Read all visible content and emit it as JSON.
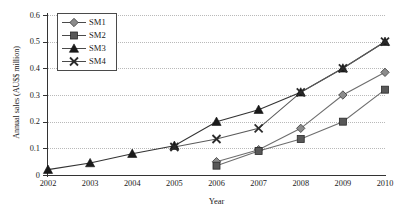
{
  "chart_data": {
    "type": "line",
    "title": "",
    "xlabel": "Year",
    "ylabel": "Annual sales (AU$$ million)",
    "categories": [
      "2002",
      "2003",
      "2004",
      "2005",
      "2006",
      "2007",
      "2008",
      "2009",
      "2010"
    ],
    "x": [
      2002,
      2003,
      2004,
      2005,
      2006,
      2007,
      2008,
      2009,
      2010
    ],
    "xlim": [
      2002,
      2010
    ],
    "ylim": [
      0,
      0.6
    ],
    "yticks": [
      "0",
      "0.1",
      "0.2",
      "0.3",
      "0.4",
      "0.5",
      "0.6"
    ],
    "ytick_values": [
      0,
      0.1,
      0.2,
      0.3,
      0.4,
      0.5,
      0.6
    ],
    "grid": "horizontal-dotted",
    "legend_position": "top-left-inside",
    "series": [
      {
        "name": "SM1",
        "marker": "diamond",
        "color": "#8c8c8c",
        "line_color": "#6e6e6e",
        "x": [
          2006,
          2007,
          2008,
          2009,
          2010
        ],
        "values": [
          0.05,
          0.095,
          0.175,
          0.3,
          0.385
        ]
      },
      {
        "name": "SM2",
        "marker": "square",
        "color": "#585858",
        "line_color": "#6e6e6e",
        "x": [
          2006,
          2007,
          2008,
          2009,
          2010
        ],
        "values": [
          0.035,
          0.09,
          0.135,
          0.2,
          0.32
        ]
      },
      {
        "name": "SM3",
        "marker": "triangle",
        "color": "#1a1a1a",
        "line_color": "#333333",
        "x": [
          2002,
          2003,
          2004,
          2005,
          2006,
          2007,
          2008,
          2009,
          2010
        ],
        "values": [
          0.02,
          0.045,
          0.08,
          0.11,
          0.2,
          0.245,
          0.31,
          0.4,
          0.5
        ]
      },
      {
        "name": "SM4",
        "marker": "cross",
        "color": "#2b2b2b",
        "line_color": "#5a5a5a",
        "x": [
          2005,
          2006,
          2007,
          2008,
          2009,
          2010
        ],
        "values": [
          0.105,
          0.135,
          0.175,
          0.31,
          0.4,
          0.5
        ]
      }
    ]
  }
}
